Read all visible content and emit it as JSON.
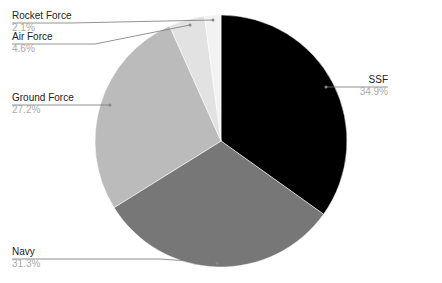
{
  "chart_data": {
    "type": "pie",
    "title": "",
    "categories": [
      "SSF",
      "Navy",
      "Ground Force",
      "Air Force",
      "Rocket Force"
    ],
    "values": [
      34.9,
      31.3,
      27.2,
      4.6,
      2.1
    ],
    "value_labels": [
      "34.9%",
      "31.3%",
      "27.2%",
      "4.6%",
      "2.1%"
    ],
    "colors": [
      "#000000",
      "#777777",
      "#bbbbbb",
      "#e2e2e2",
      "#f2f2f2"
    ],
    "start_angle": "12 o'clock, clockwise",
    "legend": "none (leader-line labels)"
  },
  "labels": {
    "ssf": {
      "name": "SSF",
      "pct": "34.9%"
    },
    "navy": {
      "name": "Navy",
      "pct": "31.3%"
    },
    "ground": {
      "name": "Ground Force",
      "pct": "27.2%"
    },
    "air": {
      "name": "Air Force",
      "pct": "4.6%"
    },
    "rocket": {
      "name": "Rocket Force",
      "pct": "2.1%"
    }
  }
}
